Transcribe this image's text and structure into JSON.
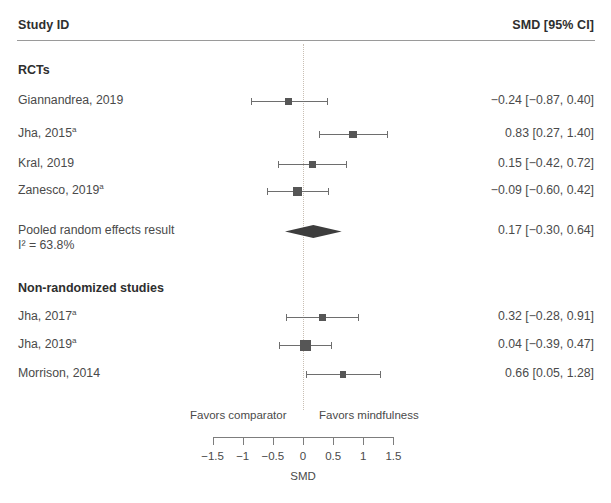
{
  "header": {
    "study_label": "Study ID",
    "estimate_label": "SMD [95% CI]"
  },
  "groups": [
    {
      "id": "rcts",
      "label": "RCTs"
    },
    {
      "id": "nonrandomized",
      "label": "Non-randomized studies"
    }
  ],
  "rows": [
    {
      "label": "Giannandrea, 2019",
      "footnote": "",
      "value_text": "−0.24 [−0.87, 0.40]"
    },
    {
      "label": "Jha, 2015",
      "footnote": "a",
      "value_text": "0.83 [0.27, 1.40]"
    },
    {
      "label": "Kral, 2019",
      "footnote": "",
      "value_text": "0.15 [−0.42, 0.72]"
    },
    {
      "label": "Zanesco, 2019",
      "footnote": "a",
      "value_text": "−0.09 [−0.60, 0.42]"
    },
    {
      "label": "Pooled random effects result",
      "footnote": "",
      "sublabel": "I² = 63.8%",
      "value_text": "0.17 [−0.30, 0.64]"
    },
    {
      "label": "Jha, 2017",
      "footnote": "a",
      "value_text": "0.32 [−0.28, 0.91]"
    },
    {
      "label": "Jha, 2019",
      "footnote": "a",
      "value_text": "0.04 [−0.39, 0.47]"
    },
    {
      "label": "Morrison, 2014",
      "footnote": "",
      "value_text": "0.66 [0.05, 1.28]"
    }
  ],
  "axis": {
    "title": "SMD",
    "favors_left": "Favors comparator",
    "favors_right": "Favors mindfulness",
    "tick_labels": [
      "−1.5",
      "−1",
      "−0.5",
      "0",
      "0.5",
      "1",
      "1.5"
    ]
  },
  "colors": {
    "marker": "#565656",
    "ci": "#6e6e6e",
    "diamond": "#3d3d3d",
    "zero_line": "#c9bfb4",
    "text": "#4a4a4a",
    "background": "#ffffff"
  },
  "chart_data": {
    "type": "forest",
    "title": "",
    "xlabel": "SMD",
    "ylabel": "",
    "xlim": [
      -1.5,
      1.5
    ],
    "x_ticks": [
      -1.5,
      -1,
      -0.5,
      0,
      0.5,
      1,
      1.5
    ],
    "grid": false,
    "legend": "none",
    "null_line": 0,
    "effect_measure": "SMD",
    "ci_level": "95%",
    "heterogeneity": {
      "statistic": "I2",
      "value": 63.8,
      "unit": "%",
      "text": "I² = 63.8%"
    },
    "favors_left": "Favors comparator",
    "favors_right": "Favors mindfulness",
    "subgroups": [
      {
        "name": "RCTs",
        "studies": [
          {
            "study": "Giannandrea, 2019",
            "estimate": -0.24,
            "ci_low": -0.87,
            "ci_high": 0.4,
            "weight": 0.2
          },
          {
            "study": "Jha, 2015",
            "estimate": 0.83,
            "ci_low": 0.27,
            "ci_high": 1.4,
            "weight": 0.26
          },
          {
            "study": "Kral, 2019",
            "estimate": 0.15,
            "ci_low": -0.42,
            "ci_high": 0.72,
            "weight": 0.24
          },
          {
            "study": "Zanesco, 2019",
            "estimate": -0.09,
            "ci_low": -0.6,
            "ci_high": 0.42,
            "weight": 0.4
          }
        ],
        "pooled": {
          "study": "Pooled random effects result",
          "estimate": 0.17,
          "ci_low": -0.3,
          "ci_high": 0.64,
          "model": "random effects"
        }
      },
      {
        "name": "Non-randomized studies",
        "studies": [
          {
            "study": "Jha, 2017",
            "estimate": 0.32,
            "ci_low": -0.28,
            "ci_high": 0.91,
            "weight": 0.22
          },
          {
            "study": "Jha, 2019",
            "estimate": 0.04,
            "ci_low": -0.39,
            "ci_high": 0.47,
            "weight": 0.62
          },
          {
            "study": "Morrison, 2014",
            "estimate": 0.66,
            "ci_low": 0.05,
            "ci_high": 1.28,
            "weight": 0.18
          }
        ]
      }
    ]
  },
  "layout": {
    "zero_x": 303,
    "px_per_unit": 60.3,
    "axis_y": 437,
    "row_y": {
      "rcts_heading": 71,
      "giannandrea": 101,
      "jha2015": 134,
      "kral": 164,
      "zanesco": 191,
      "pooled": 231,
      "pooled_sub": 246,
      "nonrand_heading": 289,
      "jha2017": 317,
      "jha2019": 345,
      "morrison": 374
    },
    "marker_sizes": [
      6.5,
      7.5,
      7.0,
      9.0,
      0,
      7.0,
      11.0,
      6.5
    ]
  }
}
